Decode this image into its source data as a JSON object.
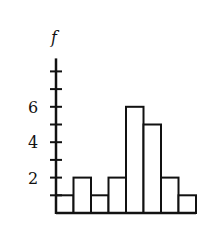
{
  "chart_data": {
    "type": "bar",
    "subtype": "histogram",
    "title": "",
    "xlabel": "",
    "ylabel": "f",
    "categories": [
      "1",
      "2",
      "3",
      "4",
      "5",
      "6",
      "7",
      "8"
    ],
    "values": [
      1,
      2,
      1,
      2,
      6,
      5,
      2,
      1
    ],
    "ylim": [
      0,
      8
    ],
    "y_ticks": [
      1,
      2,
      3,
      4,
      5,
      6,
      7,
      8
    ],
    "y_tick_labels": [
      "2",
      "4",
      "6"
    ],
    "grid": false,
    "legend": null,
    "colors": {
      "bar_fill": "#ffffff",
      "stroke": "#111111"
    }
  }
}
